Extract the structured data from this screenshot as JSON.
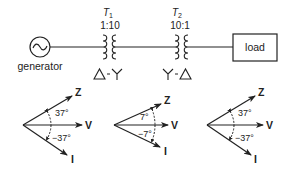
{
  "circuit": {
    "generator": {
      "label": "generator",
      "symbol": "~"
    },
    "transformers": [
      {
        "name": "T",
        "subscript": "1",
        "ratio": "1:10",
        "connection_left": "Δ",
        "connection_sep": "-",
        "connection_right": "Y"
      },
      {
        "name": "T",
        "subscript": "2",
        "ratio": "10:1",
        "connection_left": "Y",
        "connection_sep": "-",
        "connection_right": "Δ"
      }
    ],
    "load": {
      "label": "load"
    }
  },
  "phasors": [
    {
      "z_label": "Z",
      "v_label": "V",
      "i_label": "I",
      "angle_top": "37°",
      "angle_bottom": "−37°"
    },
    {
      "z_label": "Z",
      "v_label": "V",
      "i_label": "I",
      "angle_top": "7°",
      "angle_bottom": "−7°"
    },
    {
      "z_label": "Z",
      "v_label": "V",
      "i_label": "I",
      "angle_top": "37°",
      "angle_bottom": "−37°"
    }
  ],
  "colors": {
    "stroke": "#222222",
    "background": "#ffffff"
  }
}
